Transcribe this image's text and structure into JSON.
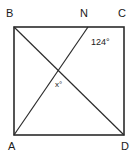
{
  "figure": {
    "type": "geometry-diagram",
    "background_color": "#ffffff",
    "stroke_color": "#2b2b2b",
    "text_color": "#1a1a1a"
  },
  "shape": {
    "name": "square",
    "vertices": [
      {
        "key": "B",
        "label": "B",
        "position": "top-left",
        "x": 14,
        "y": 27
      },
      {
        "key": "C",
        "label": "C",
        "position": "top-right",
        "x": 124,
        "y": 27
      },
      {
        "key": "D",
        "label": "D",
        "position": "bottom-right",
        "x": 124,
        "y": 135
      },
      {
        "key": "A",
        "label": "A",
        "position": "bottom-left",
        "x": 14,
        "y": 135
      }
    ]
  },
  "points": [
    {
      "key": "N",
      "label": "N",
      "on_side": "BC",
      "x": 88,
      "y": 27
    }
  ],
  "segments": [
    {
      "name": "diagonal-bd",
      "from": "B",
      "to": "D",
      "x1": 14,
      "y1": 27,
      "x2": 124,
      "y2": 135
    },
    {
      "name": "segment-na",
      "from": "N",
      "to": "A",
      "x1": 88,
      "y1": 27,
      "x2": 14,
      "y2": 135
    }
  ],
  "angles": [
    {
      "name": "angle-124",
      "label": "124°",
      "value": 124,
      "unit": "degrees",
      "at_vertex": "N",
      "x": 91,
      "y": 38
    },
    {
      "name": "angle-x",
      "label": "x°",
      "value": "x",
      "unit": "degrees",
      "at_vertex": "intersection",
      "x": 55,
      "y": 81
    }
  ],
  "labels": {
    "B": "B",
    "C": "C",
    "N": "N",
    "A": "A",
    "D": "D",
    "angle_124": "124°",
    "angle_x": "x°"
  }
}
